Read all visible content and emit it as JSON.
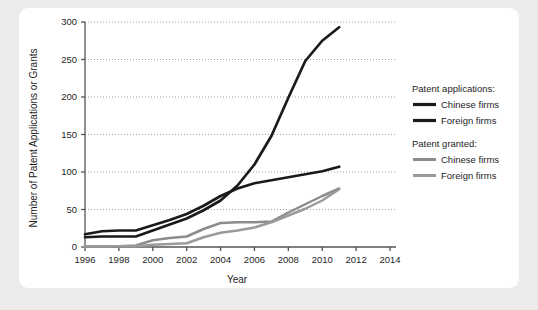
{
  "chart_data": {
    "type": "line",
    "title": "",
    "xlabel": "Year",
    "ylabel": "Number of Patent Applications or Grants",
    "xlim": [
      1996,
      2014
    ],
    "ylim": [
      0,
      300
    ],
    "xticks": [
      1996,
      1998,
      2000,
      2002,
      2004,
      2006,
      2008,
      2010,
      2012,
      2014
    ],
    "yticks": [
      0,
      50,
      100,
      150,
      200,
      250,
      300
    ],
    "grid": "horizontal-dotted",
    "legend_position": "right",
    "colors": {
      "applications_chinese": "#1a1a1a",
      "applications_foreign": "#1a1a1a",
      "granted_chinese": "#8c8c8c",
      "granted_foreign": "#9a9a9a",
      "axis": "#555555",
      "gridline": "#9a9a9a",
      "card_background": "#ffffff",
      "page_background": "#ebebeb"
    },
    "x": [
      1996,
      1997,
      1998,
      1999,
      2000,
      2001,
      2002,
      2003,
      2004,
      2005,
      2006,
      2007,
      2008,
      2009,
      2010,
      2011
    ],
    "series": [
      {
        "name": "Chinese firms",
        "group": "Patent applications:",
        "color": "#1a1a1a",
        "values": [
          13,
          14,
          14,
          14,
          22,
          30,
          38,
          49,
          62,
          82,
          110,
          148,
          199,
          248,
          275,
          293
        ]
      },
      {
        "name": "Foreign firms",
        "group": "Patent applications:",
        "color": "#1a1a1a",
        "values": [
          17,
          21,
          22,
          22,
          29,
          36,
          44,
          55,
          68,
          78,
          85,
          89,
          93,
          97,
          101,
          107
        ]
      },
      {
        "name": "Chinese firms",
        "group": "Patent granted:",
        "color": "#8c8c8c",
        "values": [
          1,
          1,
          1,
          2,
          9,
          12,
          14,
          24,
          32,
          33,
          33,
          34,
          46,
          57,
          68,
          78
        ]
      },
      {
        "name": "Foreign firms",
        "group": "Patent granted:",
        "color": "#9a9a9a",
        "values": [
          1,
          1,
          1,
          1,
          3,
          4,
          5,
          13,
          19,
          22,
          26,
          33,
          42,
          51,
          62,
          77
        ]
      }
    ]
  },
  "legend": {
    "groups": [
      {
        "heading": "Patent applications:",
        "items": [
          {
            "label": "Chinese firms",
            "color": "#1a1a1a",
            "thickness": 3.2
          },
          {
            "label": "Foreign firms",
            "color": "#1a1a1a",
            "thickness": 3.2
          }
        ]
      },
      {
        "heading": "Patent granted:",
        "items": [
          {
            "label": "Chinese firms",
            "color": "#8c8c8c",
            "thickness": 3.0
          },
          {
            "label": "Foreign firms",
            "color": "#9a9a9a",
            "thickness": 3.0
          }
        ]
      }
    ]
  }
}
